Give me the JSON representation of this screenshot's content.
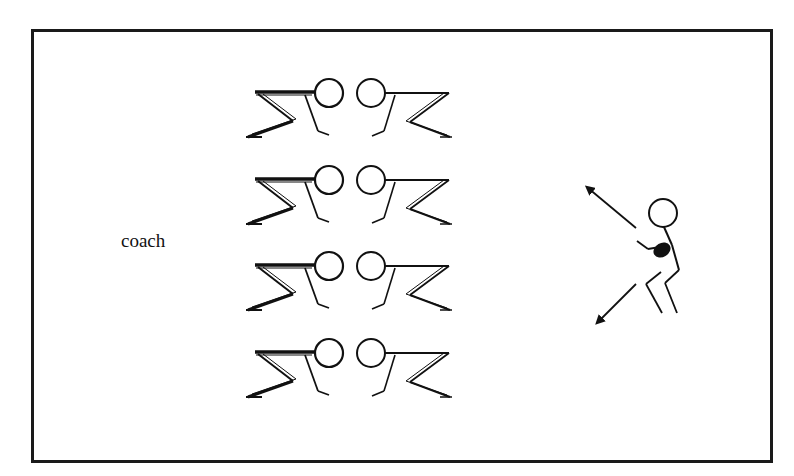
{
  "diagram": {
    "labels": {
      "coach": "coach"
    },
    "lineman_pairs": [
      {
        "row": 1,
        "y_offset": 0
      },
      {
        "row": 2,
        "y_offset": 87
      },
      {
        "row": 3,
        "y_offset": 173
      },
      {
        "row": 4,
        "y_offset": 260
      }
    ],
    "player": {
      "description": "standing player holding ball with two direction arrows",
      "arrows": [
        "up-left",
        "down-left"
      ]
    },
    "colors": {
      "stroke": "#111111",
      "background": "#ffffff"
    }
  }
}
